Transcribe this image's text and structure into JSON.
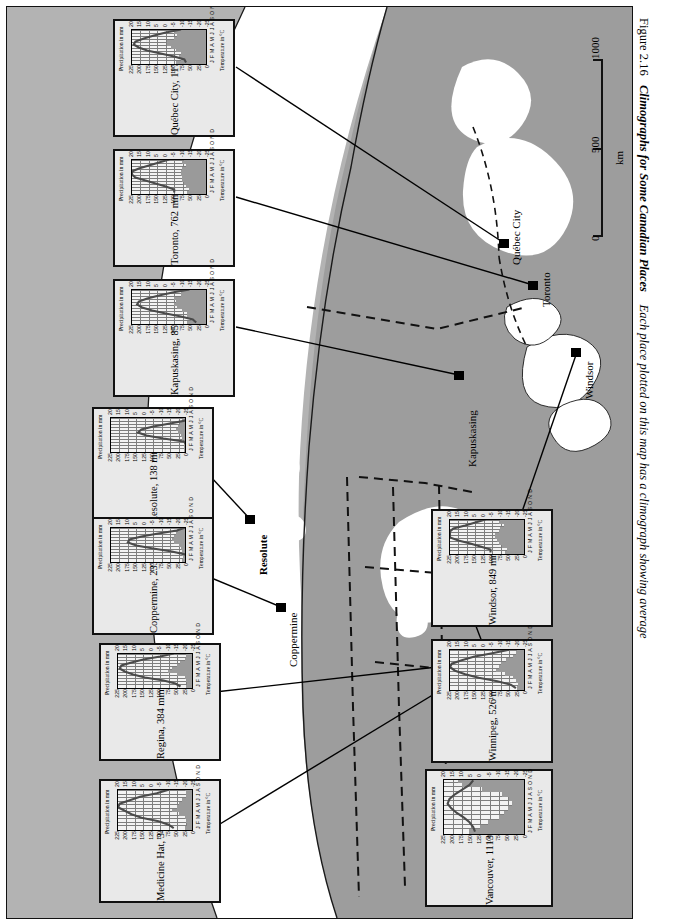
{
  "figure": {
    "number": "Figure 2.16",
    "title": "Climographs for Some Canadian Places",
    "body": "Each place plotted on this map has a climograph showing average"
  },
  "scale_bar": {
    "ticks": [
      "0",
      "500",
      "1000"
    ],
    "unit": "km"
  },
  "axes": {
    "temperature_label": "Temperature in °C",
    "precipitation_label": "Precipitation in mm",
    "months": "J F M A M J J A S O N D",
    "temperature_ticks": [
      "20",
      "15",
      "10",
      "5",
      "0",
      "-5",
      "-10",
      "-15",
      "-20",
      "-25"
    ],
    "precipitation_ticks": [
      "225",
      "200",
      "175",
      "150",
      "125",
      "100",
      "75",
      "50",
      "25",
      "0"
    ]
  },
  "colors": {
    "map_land": "#9d9d9d",
    "map_water": "#ffffff",
    "frame_bg": "#b3b3b3",
    "bar_fill": "#9a9a9a",
    "line": "#4a4a4a"
  },
  "map": {
    "cities": [
      {
        "name": "Québec City"
      },
      {
        "name": "Toronto"
      },
      {
        "name": "Windsor"
      },
      {
        "name": "Kapuskasing"
      },
      {
        "name": "Winnipeg"
      },
      {
        "name": "Regina"
      },
      {
        "name": "Medicine Hat"
      },
      {
        "name": "Vancouver"
      },
      {
        "name": "Coppermine"
      },
      {
        "name": "Resolute"
      }
    ]
  },
  "chart_data": [
    {
      "type": "bar",
      "title": "Québec City, 1174 mm",
      "station": "Québec City",
      "annual_precipitation_mm": 1174,
      "categories": [
        "J",
        "F",
        "M",
        "A",
        "M",
        "J",
        "J",
        "A",
        "S",
        "O",
        "N",
        "D"
      ],
      "xlabel": "",
      "ylabel": "Precipitation in mm",
      "y2label": "Temperature in °C",
      "ylim": [
        0,
        225
      ],
      "y2lim": [
        -25,
        20
      ],
      "series": [
        {
          "name": "Precipitation",
          "kind": "bar",
          "values": [
            90,
            75,
            80,
            75,
            90,
            105,
            115,
            115,
            95,
            85,
            95,
            100
          ]
        },
        {
          "name": "Temperature",
          "kind": "line",
          "values": [
            -12,
            -11,
            -5,
            3,
            11,
            16,
            19,
            18,
            13,
            7,
            0,
            -9
          ]
        }
      ]
    },
    {
      "type": "bar",
      "title": "Toronto, 762 mm",
      "station": "Toronto",
      "annual_precipitation_mm": 762,
      "categories": [
        "J",
        "F",
        "M",
        "A",
        "M",
        "J",
        "J",
        "A",
        "S",
        "O",
        "N",
        "D"
      ],
      "xlabel": "",
      "ylabel": "Precipitation in mm",
      "y2label": "Temperature in °C",
      "ylim": [
        0,
        225
      ],
      "y2lim": [
        -25,
        20
      ],
      "series": [
        {
          "name": "Precipitation",
          "kind": "bar",
          "values": [
            55,
            50,
            60,
            65,
            70,
            70,
            75,
            75,
            70,
            60,
            70,
            65
          ]
        },
        {
          "name": "Temperature",
          "kind": "line",
          "values": [
            -5,
            -5,
            0,
            6,
            12,
            18,
            21,
            20,
            16,
            10,
            4,
            -2
          ]
        }
      ]
    },
    {
      "type": "bar",
      "title": "Kapuskasing, 858 mm",
      "station": "Kapuskasing",
      "annual_precipitation_mm": 858,
      "categories": [
        "J",
        "F",
        "M",
        "A",
        "M",
        "J",
        "J",
        "A",
        "S",
        "O",
        "N",
        "D"
      ],
      "xlabel": "",
      "ylabel": "Precipitation in mm",
      "y2label": "Temperature in °C",
      "ylim": [
        0,
        225
      ],
      "y2lim": [
        -25,
        20
      ],
      "series": [
        {
          "name": "Precipitation",
          "kind": "bar",
          "values": [
            55,
            45,
            55,
            55,
            70,
            85,
            95,
            90,
            95,
            75,
            75,
            65
          ]
        },
        {
          "name": "Temperature",
          "kind": "line",
          "values": [
            -18,
            -16,
            -9,
            0,
            8,
            14,
            17,
            16,
            11,
            4,
            -4,
            -14
          ]
        }
      ]
    },
    {
      "type": "bar",
      "title": "Resolute, 138 mm",
      "station": "Resolute",
      "annual_precipitation_mm": 138,
      "categories": [
        "J",
        "F",
        "M",
        "A",
        "M",
        "J",
        "J",
        "A",
        "S",
        "O",
        "N",
        "D"
      ],
      "xlabel": "",
      "ylabel": "Precipitation in mm",
      "y2label": "Temperature in °C",
      "ylim": [
        0,
        225
      ],
      "y2lim": [
        -25,
        20
      ],
      "series": [
        {
          "name": "Precipitation",
          "kind": "bar",
          "values": [
            4,
            3,
            4,
            6,
            8,
            12,
            22,
            28,
            20,
            14,
            8,
            6
          ]
        },
        {
          "name": "Temperature",
          "kind": "line",
          "values": [
            -32,
            -33,
            -31,
            -23,
            -11,
            -1,
            4,
            2,
            -5,
            -15,
            -24,
            -29
          ]
        }
      ]
    },
    {
      "type": "bar",
      "title": "Coppermine, 233 mm",
      "station": "Coppermine",
      "annual_precipitation_mm": 233,
      "categories": [
        "J",
        "F",
        "M",
        "A",
        "M",
        "J",
        "J",
        "A",
        "S",
        "O",
        "N",
        "D"
      ],
      "xlabel": "",
      "ylabel": "Precipitation in mm",
      "y2label": "Temperature in °C",
      "ylim": [
        0,
        225
      ],
      "y2lim": [
        -25,
        20
      ],
      "series": [
        {
          "name": "Precipitation",
          "kind": "bar",
          "values": [
            8,
            7,
            8,
            10,
            12,
            18,
            34,
            38,
            32,
            26,
            20,
            12
          ]
        },
        {
          "name": "Temperature",
          "kind": "line",
          "values": [
            -27,
            -28,
            -24,
            -16,
            -5,
            5,
            10,
            9,
            2,
            -8,
            -19,
            -24
          ]
        }
      ]
    },
    {
      "type": "bar",
      "title": "Regina, 384 mm",
      "station": "Regina",
      "annual_precipitation_mm": 384,
      "categories": [
        "J",
        "F",
        "M",
        "A",
        "M",
        "J",
        "J",
        "A",
        "S",
        "O",
        "N",
        "D"
      ],
      "xlabel": "",
      "ylabel": "Precipitation in mm",
      "y2label": "Temperature in °C",
      "ylim": [
        0,
        225
      ],
      "y2lim": [
        -25,
        20
      ],
      "series": [
        {
          "name": "Precipitation",
          "kind": "bar",
          "values": [
            18,
            14,
            18,
            22,
            45,
            70,
            60,
            45,
            35,
            22,
            18,
            17
          ]
        },
        {
          "name": "Temperature",
          "kind": "line",
          "values": [
            -17,
            -14,
            -7,
            4,
            11,
            16,
            19,
            18,
            12,
            5,
            -5,
            -13
          ]
        }
      ]
    },
    {
      "type": "bar",
      "title": "Medicine Hat, 347 mm",
      "station": "Medicine Hat",
      "annual_precipitation_mm": 347,
      "categories": [
        "J",
        "F",
        "M",
        "A",
        "M",
        "J",
        "J",
        "A",
        "S",
        "O",
        "N",
        "D"
      ],
      "xlabel": "",
      "ylabel": "Precipitation in mm",
      "y2label": "Temperature in °C",
      "ylim": [
        0,
        225
      ],
      "y2lim": [
        -25,
        20
      ],
      "series": [
        {
          "name": "Precipitation",
          "kind": "bar",
          "values": [
            20,
            15,
            18,
            22,
            40,
            58,
            45,
            38,
            30,
            18,
            18,
            20
          ]
        },
        {
          "name": "Temperature",
          "kind": "line",
          "values": [
            -13,
            -10,
            -4,
            6,
            12,
            16,
            20,
            19,
            13,
            7,
            -3,
            -10
          ]
        }
      ]
    },
    {
      "type": "bar",
      "title": "Windsor, 849 mm",
      "station": "Windsor",
      "annual_precipitation_mm": 849,
      "categories": [
        "J",
        "F",
        "M",
        "A",
        "M",
        "J",
        "J",
        "A",
        "S",
        "O",
        "N",
        "D"
      ],
      "xlabel": "",
      "ylabel": "Precipitation in mm",
      "y2label": "Temperature in °C",
      "ylim": [
        0,
        225
      ],
      "y2lim": [
        -25,
        20
      ],
      "series": [
        {
          "name": "Precipitation",
          "kind": "bar",
          "values": [
            55,
            50,
            65,
            75,
            80,
            85,
            85,
            75,
            70,
            60,
            75,
            70
          ]
        },
        {
          "name": "Temperature",
          "kind": "line",
          "values": [
            -4,
            -4,
            2,
            8,
            15,
            20,
            23,
            22,
            18,
            11,
            5,
            -1
          ]
        }
      ]
    },
    {
      "type": "bar",
      "title": "Winnipeg, 526 mm",
      "station": "Winnipeg",
      "annual_precipitation_mm": 526,
      "categories": [
        "J",
        "F",
        "M",
        "A",
        "M",
        "J",
        "J",
        "A",
        "S",
        "O",
        "N",
        "D"
      ],
      "xlabel": "",
      "ylabel": "Precipitation in mm",
      "y2label": "Temperature in °C",
      "ylim": [
        0,
        225
      ],
      "y2lim": [
        -25,
        20
      ],
      "series": [
        {
          "name": "Precipitation",
          "kind": "bar",
          "values": [
            22,
            18,
            25,
            32,
            55,
            82,
            75,
            68,
            52,
            32,
            25,
            22
          ]
        },
        {
          "name": "Temperature",
          "kind": "line",
          "values": [
            -19,
            -16,
            -8,
            3,
            11,
            17,
            20,
            19,
            13,
            6,
            -5,
            -15
          ]
        }
      ]
    },
    {
      "type": "bar",
      "title": "Vancouver, 1113 mm",
      "station": "Vancouver",
      "annual_precipitation_mm": 1113,
      "categories": [
        "J",
        "F",
        "M",
        "A",
        "M",
        "J",
        "J",
        "A",
        "S",
        "O",
        "N",
        "D"
      ],
      "xlabel": "",
      "ylabel": "Precipitation in mm",
      "y2label": "Temperature in °C",
      "ylim": [
        0,
        225
      ],
      "y2lim": [
        -25,
        20
      ],
      "series": [
        {
          "name": "Precipitation",
          "kind": "bar",
          "values": [
            150,
            120,
            100,
            70,
            55,
            45,
            32,
            40,
            60,
            115,
            170,
            180
          ]
        },
        {
          "name": "Temperature",
          "kind": "line",
          "values": [
            3,
            4,
            6,
            9,
            13,
            16,
            18,
            17,
            14,
            10,
            6,
            4
          ]
        }
      ]
    }
  ]
}
